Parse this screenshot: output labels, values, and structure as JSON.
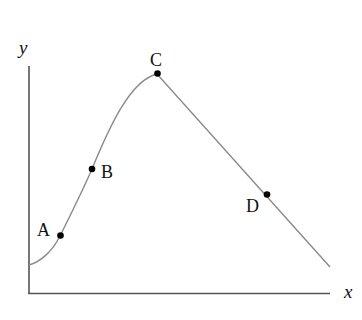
{
  "diagram": {
    "type": "function-graph",
    "axes": {
      "x_label": "x",
      "y_label": "y",
      "color": "#555555"
    },
    "curve": {
      "color": "#8a8a8a",
      "description": "Curve rises from the y-axis, concave up through A, steeper through B, peaks at C, then decreases linearly through D"
    },
    "points": [
      {
        "label": "A",
        "description": "on increasing, concave-up portion"
      },
      {
        "label": "B",
        "description": "on increasing portion, near inflection"
      },
      {
        "label": "C",
        "description": "local maximum (peak)"
      },
      {
        "label": "D",
        "description": "on decreasing linear portion"
      }
    ],
    "point_color": "#000000"
  }
}
